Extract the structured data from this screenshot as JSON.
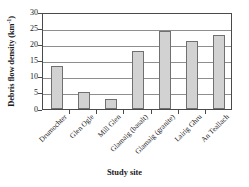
{
  "chart_data": {
    "type": "bar",
    "title": "",
    "xlabel": "Study site",
    "ylabel": "Debris flow density (km",
    "ylabel_superscript": "-1",
    "ylabel_suffix": ")",
    "categories": [
      "Drumochter",
      "Glen Ogle",
      "Mill Glen",
      "Glamaig (basalt)",
      "Glamaig (granite)",
      "Lairig Ghru",
      "An Teallach"
    ],
    "values": [
      13.2,
      5.2,
      3.0,
      17.8,
      24.0,
      21.0,
      22.7
    ],
    "ylim": [
      0,
      30
    ],
    "ytick_values": [
      0,
      5,
      10,
      15,
      20,
      25,
      30
    ],
    "ytick_labels": [
      "0",
      "5",
      "10",
      "15",
      "20",
      "25",
      "30"
    ],
    "grid": true,
    "legend": false,
    "bar_fill_color": "#d2d2d2",
    "bar_border_color": "#707070",
    "axis_color": "#4a4a4a",
    "gridline_color": "#8e8e8e"
  }
}
